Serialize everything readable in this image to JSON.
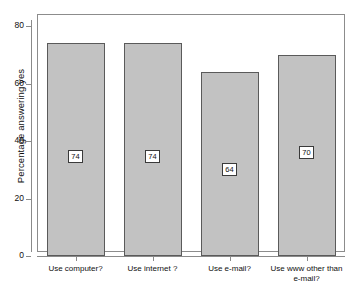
{
  "chart_data": {
    "type": "bar",
    "title": "",
    "xlabel": "",
    "ylabel": "Percentage answering yes",
    "categories": [
      "Use computer?",
      "Use internet ?",
      "Use e-mail?",
      "Use www other than\ne-mail?"
    ],
    "values": [
      74,
      74,
      64,
      70
    ],
    "data_labels": [
      "74",
      "74",
      "64",
      "70"
    ],
    "ylim": [
      0,
      80
    ],
    "yticks": [
      0,
      20,
      40,
      60,
      80
    ],
    "ytick_labels": [
      "0",
      "20",
      "40",
      "60",
      "80"
    ],
    "grid": false,
    "legend": null,
    "bar_fill_color": "#c2c2c2",
    "bar_border_color": "#5a5a5a",
    "axis_color": "#8a8a8a",
    "background_color": "#ffffff"
  }
}
